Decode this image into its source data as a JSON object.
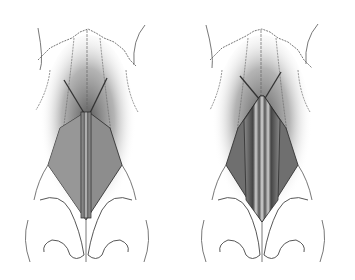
{
  "figure": {
    "type": "medical-illustration",
    "panels": [
      {
        "id": "left",
        "description": "single midline graft between upper lateral cartilages"
      },
      {
        "id": "right",
        "description": "bilateral spreader grafts with midline graft"
      }
    ]
  },
  "colors": {
    "background": "#ffffff",
    "line": "#3a3a3a",
    "shadow": "#555555",
    "graft_dark": "#4a4a4a",
    "graft_mid": "#8a8a8a",
    "graft_light": "#c8c8c8"
  }
}
